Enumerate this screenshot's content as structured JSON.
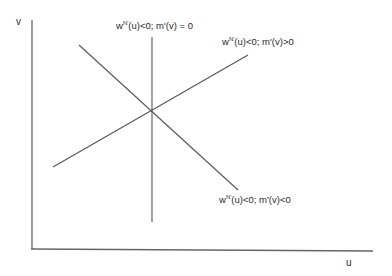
{
  "axes": {
    "x_label": "u",
    "y_label": "v"
  },
  "curves": [
    {
      "id": "vertical",
      "label_prefix": "w",
      "label_sup": "N'",
      "label_suffix": "(u)<0; m'(v) = 0",
      "x1": 152,
      "y1": 37,
      "x2": 152,
      "y2": 222
    },
    {
      "id": "upward",
      "label_prefix": "w",
      "label_sup": "N'",
      "label_suffix": "(u)<0; m'(v)>0",
      "x1": 53,
      "y1": 167,
      "x2": 248,
      "y2": 55
    },
    {
      "id": "downward",
      "label_prefix": "w",
      "label_sup": "N'",
      "label_suffix": "(u)<0; m'(v)<0",
      "x1": 79,
      "y1": 45,
      "x2": 238,
      "y2": 190
    }
  ],
  "intersection": {
    "x": 152,
    "y": 112
  },
  "colors": {
    "line": "#555555",
    "axis": "#666666"
  }
}
